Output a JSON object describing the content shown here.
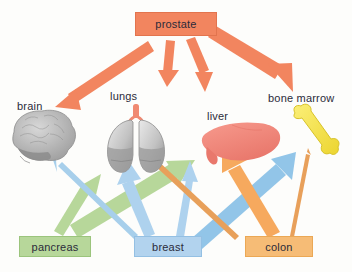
{
  "diagram": {
    "background_color": "#fdfdfb",
    "text_color": "#2b2b3a"
  },
  "primary_tumors": [
    {
      "id": "prostate",
      "label": "prostate",
      "fill": "#f2855f",
      "border": "#e2744e",
      "x": 135,
      "y": 12,
      "w": 82,
      "h": 24,
      "position": "top-center"
    },
    {
      "id": "pancreas",
      "label": "pancreas",
      "fill": "#b7d79a",
      "border": "#9bc47c",
      "x": 19,
      "y": 236,
      "w": 72,
      "h": 21,
      "position": "bottom-left"
    },
    {
      "id": "breast",
      "label": "breast",
      "fill": "#b2d3ee",
      "border": "#94c0e3",
      "x": 134,
      "y": 236,
      "w": 68,
      "h": 21,
      "position": "bottom-center"
    },
    {
      "id": "colon",
      "label": "colon",
      "fill": "#f6bc76",
      "border": "#eba855",
      "x": 245,
      "y": 236,
      "w": 68,
      "h": 21,
      "position": "bottom-right"
    }
  ],
  "target_organs": [
    {
      "id": "brain",
      "label": "brain",
      "icon": "brain-icon",
      "color": "#9a9a9a",
      "label_x": 17,
      "label_y": 100
    },
    {
      "id": "lungs",
      "label": "lungs",
      "icon": "lungs-icon",
      "color": "#b5b5b5",
      "label_x": 110,
      "label_y": 92
    },
    {
      "id": "liver",
      "label": "liver",
      "icon": "liver-icon",
      "color": "#ef8479",
      "label_x": 207,
      "label_y": 112
    },
    {
      "id": "bone_marrow",
      "label": "bone marrow",
      "icon": "bone-icon",
      "color": "#f5e14e",
      "label_x": 270,
      "label_y": 94
    }
  ],
  "arrows": [
    {
      "id": "prostate-brain",
      "from": "prostate",
      "to": "brain",
      "color": "#f2855f",
      "width": 11,
      "weight": "medium"
    },
    {
      "id": "prostate-lungs",
      "from": "prostate",
      "to": "lungs",
      "color": "#f2855f",
      "width": 8,
      "weight": "thin"
    },
    {
      "id": "prostate-liver",
      "from": "prostate",
      "to": "liver",
      "color": "#f2855f",
      "width": 9,
      "weight": "thin"
    },
    {
      "id": "prostate-bone-marrow",
      "from": "prostate",
      "to": "bone_marrow",
      "color": "#f2855f",
      "width": 15,
      "weight": "thick"
    },
    {
      "id": "pancreas-brain",
      "from": "pancreas",
      "to": "brain",
      "color": "#b7d79a",
      "width": 10,
      "weight": "medium"
    },
    {
      "id": "pancreas-liver",
      "from": "pancreas",
      "to": "liver",
      "color": "#b7d79a",
      "width": 14,
      "weight": "thick"
    },
    {
      "id": "breast-brain",
      "from": "breast",
      "to": "brain",
      "color": "#b2d3ee",
      "width": 5,
      "weight": "thin"
    },
    {
      "id": "breast-lungs",
      "from": "breast",
      "to": "lungs",
      "color": "#b2d3ee",
      "width": 11,
      "weight": "medium"
    },
    {
      "id": "breast-liver",
      "from": "breast",
      "to": "liver",
      "color": "#b2d3ee",
      "width": 7,
      "weight": "thin"
    },
    {
      "id": "breast-bone-marrow",
      "from": "breast",
      "to": "bone_marrow",
      "color": "#92c5e8",
      "width": 14,
      "weight": "thick"
    },
    {
      "id": "colon-lungs",
      "from": "colon",
      "to": "lungs",
      "color": "#e8a05a",
      "width": 4,
      "weight": "thin"
    },
    {
      "id": "colon-liver",
      "from": "colon",
      "to": "liver",
      "color": "#f6a95e",
      "width": 16,
      "weight": "thick"
    },
    {
      "id": "colon-bone-marrow",
      "from": "colon",
      "to": "bone_marrow",
      "color": "#e8a05a",
      "width": 3,
      "weight": "thin"
    }
  ]
}
